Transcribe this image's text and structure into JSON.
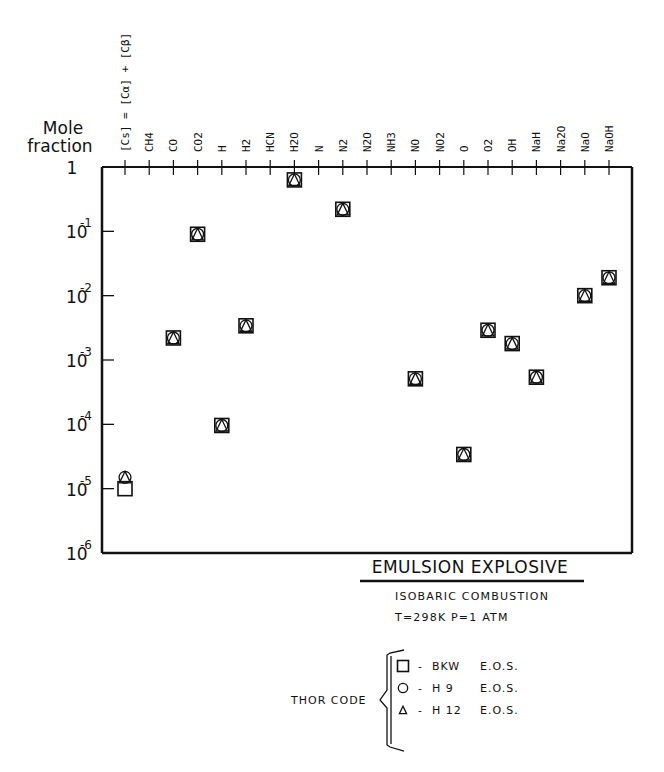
{
  "chart_data": {
    "type": "scatter",
    "title": "EMULSION EXPLOSIVE",
    "subtitle": [
      "ISOBARIC COMBUSTION",
      "T=298K   P=1 ATM"
    ],
    "ylabel": "Mole fraction",
    "yscale": "log",
    "ylim": [
      1e-06,
      1
    ],
    "yticks": [
      {
        "label": "1",
        "exp": "",
        "value": 1
      },
      {
        "label": "10",
        "exp": "-1",
        "value": 0.1
      },
      {
        "label": "10",
        "exp": "-2",
        "value": 0.01
      },
      {
        "label": "10",
        "exp": "-3",
        "value": 0.001
      },
      {
        "label": "10",
        "exp": "-4",
        "value": 0.0001
      },
      {
        "label": "10",
        "exp": "-5",
        "value": 1e-05
      },
      {
        "label": "10",
        "exp": "-6",
        "value": 1e-06
      }
    ],
    "categories": [
      "[Cs] = [Cα] + [Cβ]",
      "CH4",
      "CO",
      "CO2",
      "H",
      "H2",
      "HCN",
      "H2O",
      "N",
      "N2",
      "N2O",
      "NH3",
      "NO",
      "NO2",
      "O",
      "O2",
      "OH",
      "NaH",
      "Na2O",
      "NaO",
      "NaOH"
    ],
    "series": [
      {
        "name": "BKW E.O.S.",
        "marker": "square",
        "values": [
          1e-05,
          null,
          0.0022,
          0.09,
          9.6e-05,
          0.0034,
          null,
          0.63,
          null,
          0.22,
          null,
          null,
          0.00051,
          null,
          3.4e-05,
          0.0029,
          0.0018,
          0.00054,
          null,
          0.01,
          0.019
        ]
      },
      {
        "name": "H 9 E.O.S.",
        "marker": "circle",
        "values": [
          1.5e-05,
          null,
          0.0022,
          0.09,
          9.6e-05,
          0.0034,
          null,
          0.63,
          null,
          0.22,
          null,
          null,
          0.00051,
          null,
          3.4e-05,
          0.0029,
          0.0018,
          0.00054,
          null,
          0.01,
          0.019
        ]
      },
      {
        "name": "H 12 E.O.S.",
        "marker": "triangle",
        "values": [
          1.5e-05,
          null,
          0.0022,
          0.09,
          9.6e-05,
          0.0034,
          null,
          0.63,
          null,
          0.22,
          null,
          null,
          0.00051,
          null,
          3.4e-05,
          0.0029,
          0.0018,
          0.00054,
          null,
          0.01,
          0.019
        ]
      }
    ],
    "legend": {
      "group_label": "THOR CODE",
      "entries": [
        {
          "marker": "square",
          "code": "BKW",
          "eos": "E.O.S."
        },
        {
          "marker": "circle",
          "code": "H 9",
          "eos": "E.O.S."
        },
        {
          "marker": "triangle",
          "code": "H 12",
          "eos": "E.O.S."
        }
      ],
      "position": "bottom-center"
    },
    "grid": false
  },
  "labels": {
    "ylabel_line1": "Mole",
    "ylabel_line2": "fraction",
    "title": "EMULSION EXPLOSIVE",
    "sub1": "ISOBARIC  COMBUSTION",
    "sub2": "T=298K    P=1 ATM",
    "legend_group": "THOR CODE",
    "legend_dash": "-"
  },
  "colors": {
    "ink": "#111111",
    "background": "#ffffff"
  }
}
